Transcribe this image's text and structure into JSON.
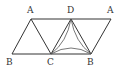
{
  "diagram": {
    "type": "geometry-figure",
    "labels": {
      "A_left": "A",
      "D": "D",
      "A_right": "A",
      "B_left": "B",
      "C": "C",
      "B_right": "B"
    },
    "colors": {
      "line": "#333333",
      "background": "#ffffff"
    }
  }
}
